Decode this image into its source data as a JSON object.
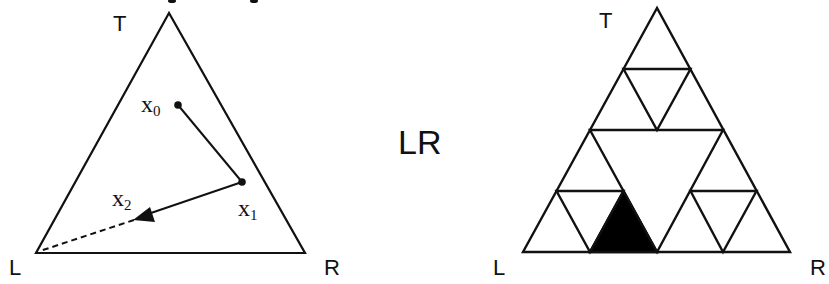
{
  "left_figure": {
    "vertices": {
      "top": "T",
      "left": "L",
      "right": "R"
    },
    "points": [
      {
        "name": "x",
        "sub": "0"
      },
      {
        "name": "x",
        "sub": "1"
      },
      {
        "name": "x",
        "sub": "2"
      }
    ]
  },
  "center_label": "LR",
  "right_figure": {
    "vertices": {
      "top": "T",
      "left": "L",
      "right": "R"
    },
    "highlighted_region": "LR"
  },
  "colors": {
    "stroke": "#111111",
    "fill_highlight": "#000000",
    "background": "#ffffff"
  }
}
